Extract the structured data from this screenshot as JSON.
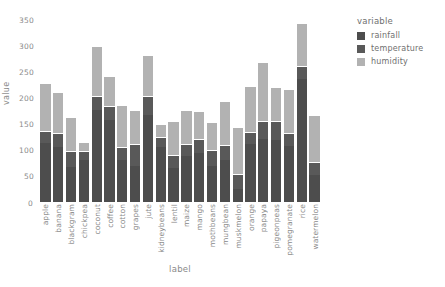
{
  "chart_data": {
    "type": "bar",
    "stacked": true,
    "title": "",
    "xlabel": "label",
    "ylabel": "value",
    "ylim": [
      0,
      350
    ],
    "yticks": [
      "0",
      "50",
      "100",
      "150",
      "200",
      "250",
      "300",
      "350"
    ],
    "grid": false,
    "legend": {
      "title": "variable",
      "position": "right",
      "entries": [
        {
          "name": "rainfall",
          "color": "#4d4d4d"
        },
        {
          "name": "temperature",
          "color": "#595959"
        },
        {
          "name": "humidity",
          "color": "#b2b2b2"
        }
      ]
    },
    "categories": [
      "apple",
      "banana",
      "blackgram",
      "chickpea",
      "coconut",
      "coffee",
      "cotton",
      "grapes",
      "jute",
      "kidneybeans",
      "lentil",
      "maize",
      "mango",
      "mothbeans",
      "mungbean",
      "muskmelon",
      "orange",
      "papaya",
      "pigeonpeas",
      "pomegranate",
      "rice",
      "watermelon"
    ],
    "series": [
      {
        "name": "rainfall",
        "color": "#4d4d4d",
        "values": [
          113,
          105,
          68,
          80,
          176,
          158,
          80,
          70,
          168,
          106,
          65,
          89,
          94,
          70,
          80,
          25,
          111,
          122,
          120,
          108,
          237,
          51
        ]
      },
      {
        "name": "temperature",
        "color": "#595959",
        "values": [
          23,
          27,
          30,
          18,
          28,
          26,
          26,
          42,
          35,
          20,
          25,
          23,
          27,
          31,
          29,
          28,
          23,
          34,
          36,
          24,
          24,
          26
        ]
      },
      {
        "name": "humidity",
        "color": "#b2b2b2",
        "values": [
          92,
          80,
          65,
          17,
          96,
          59,
          80,
          65,
          80,
          24,
          65,
          65,
          55,
          52,
          85,
          92,
          90,
          114,
          66,
          86,
          84,
          90
        ]
      }
    ],
    "totals": [
      228,
      212,
      163,
      115,
      300,
      243,
      186,
      177,
      283,
      150,
      155,
      177,
      176,
      153,
      194,
      145,
      224,
      270,
      222,
      218,
      345,
      167
    ]
  }
}
